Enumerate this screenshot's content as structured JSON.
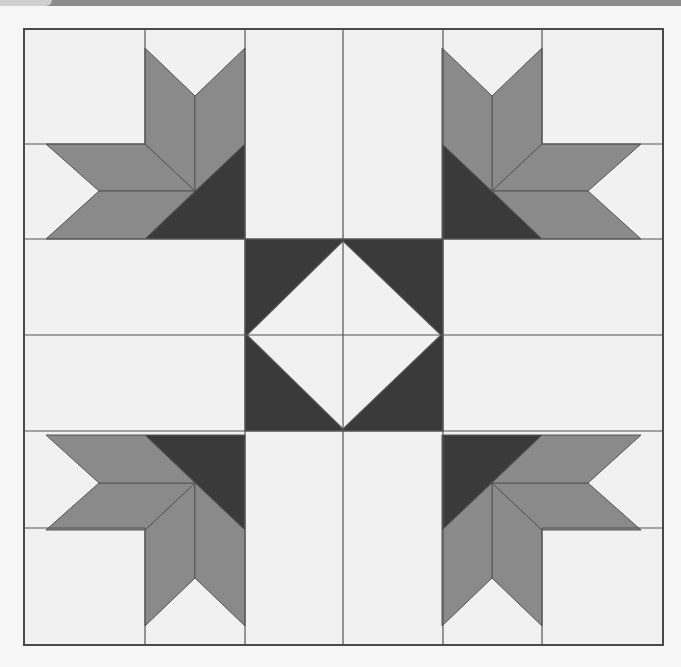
{
  "image": {
    "description": "Quilt block pattern: four corner stars with dark triangles and a central square-in-a-square diamond",
    "width": 681,
    "height": 667
  },
  "colors": {
    "background": "#f6f6f6",
    "light_fabric": "#f1f1f1",
    "medium_fabric": "#8a8a8a",
    "dark_fabric": "#3a3a3a",
    "seam_line": "#555555",
    "top_strip": "#8d8d8d"
  },
  "quilt": {
    "bounds": {
      "left": 24,
      "top": 29,
      "right": 663,
      "bottom": 645
    },
    "column_lines": [
      24,
      145,
      245,
      343,
      443,
      542,
      663
    ],
    "row_lines": [
      29,
      144,
      239,
      335,
      431,
      528,
      645
    ],
    "corner_blocks": [
      {
        "position": "top-left",
        "type": "star-corner"
      },
      {
        "position": "top-right",
        "type": "star-corner"
      },
      {
        "position": "bottom-left",
        "type": "star-corner"
      },
      {
        "position": "bottom-right",
        "type": "star-corner"
      }
    ],
    "center_block": {
      "type": "square-in-a-square"
    }
  }
}
